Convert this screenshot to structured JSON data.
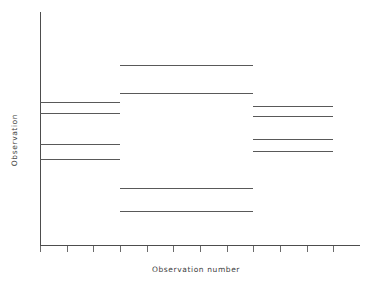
{
  "chart_data": {
    "type": "line",
    "title": "",
    "subtitle": "",
    "xlabel": "Observation number",
    "ylabel": "Observation",
    "grid": false,
    "legend": null,
    "legend_position": "none",
    "xlim": [
      0,
      12
    ],
    "ylim": [
      0,
      10
    ],
    "x_tick_labels": [],
    "y_tick_labels": [],
    "x_ticks": [
      0,
      1,
      2,
      3,
      4,
      5,
      6,
      7,
      8,
      9,
      10,
      11
    ],
    "y_ticks": [],
    "annotations": [],
    "series": [
      {
        "name": "block-1",
        "x_start": 0.0,
        "x_end": 3.0,
        "values": [
          6.13,
          5.68,
          4.34,
          3.68
        ],
        "segments": [
          {
            "id": "b1-s1",
            "x_start": 0.0,
            "x_end": 3.0,
            "y": 6.13
          },
          {
            "id": "b1-s2",
            "x_start": 0.0,
            "x_end": 3.0,
            "y": 5.68
          },
          {
            "id": "b1-s3",
            "x_start": 0.0,
            "x_end": 3.0,
            "y": 4.34
          },
          {
            "id": "b1-s4",
            "x_start": 0.0,
            "x_end": 3.0,
            "y": 3.68
          }
        ]
      },
      {
        "name": "block-2",
        "x_start": 3.0,
        "x_end": 8.0,
        "values": [
          7.71,
          6.53,
          2.45,
          1.48
        ],
        "segments": [
          {
            "id": "b2-s1",
            "x_start": 3.0,
            "x_end": 8.0,
            "y": 7.71
          },
          {
            "id": "b2-s2",
            "x_start": 3.0,
            "x_end": 8.0,
            "y": 6.53
          },
          {
            "id": "b2-s3",
            "x_start": 3.0,
            "x_end": 8.0,
            "y": 2.45
          },
          {
            "id": "b2-s4",
            "x_start": 3.0,
            "x_end": 8.0,
            "y": 1.48
          }
        ]
      },
      {
        "name": "block-3",
        "x_start": 8.0,
        "x_end": 11.0,
        "values": [
          5.98,
          5.53,
          4.53,
          4.05
        ],
        "segments": [
          {
            "id": "b3-s1",
            "x_start": 8.0,
            "x_end": 11.0,
            "y": 5.98
          },
          {
            "id": "b3-s2",
            "x_start": 8.0,
            "x_end": 11.0,
            "y": 5.53
          },
          {
            "id": "b3-s3",
            "x_start": 8.0,
            "x_end": 11.0,
            "y": 4.53
          },
          {
            "id": "b3-s4",
            "x_start": 8.0,
            "x_end": 11.0,
            "y": 4.05
          }
        ]
      }
    ]
  },
  "colors": {
    "background": "#ffffff",
    "axis": "#4d4d4d",
    "tick": "#6b6b6b",
    "line": "#595959",
    "label_text": "#3d3d3d"
  }
}
